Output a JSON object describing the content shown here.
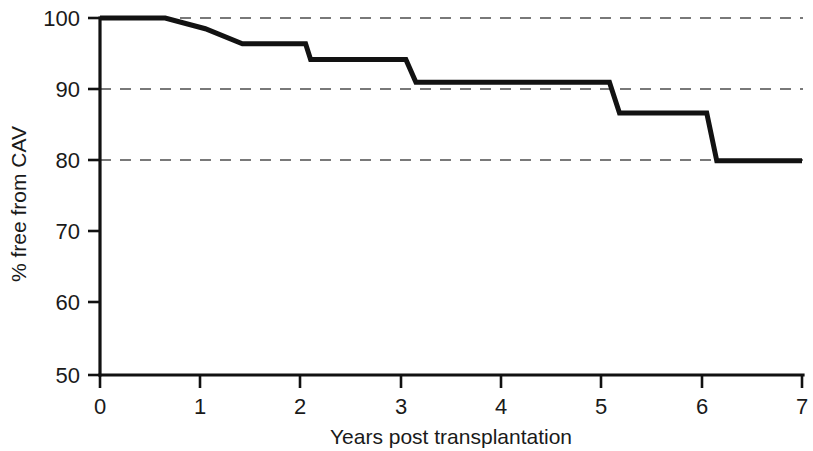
{
  "chart_data": {
    "type": "line",
    "title": "",
    "subtitle": "",
    "xlabel": "Years post transplantation",
    "ylabel": "% free from CAV",
    "xlim": [
      0,
      7
    ],
    "ylim": [
      50,
      100
    ],
    "x_ticks": [
      "0",
      "1",
      "2",
      "3",
      "4",
      "5",
      "6",
      "7"
    ],
    "x_tick_values": [
      0,
      1,
      2,
      3,
      4,
      5,
      6,
      7
    ],
    "y_ticks": [
      "50",
      "60",
      "70",
      "80",
      "90",
      "100"
    ],
    "y_tick_values": [
      50,
      60,
      70,
      80,
      90,
      100
    ],
    "grid": "horizontal dashed gridlines at y = 80, 90, 100",
    "gridline_values": [
      80,
      90,
      100
    ],
    "legend": "none",
    "annotations": [],
    "curve_style": "step",
    "line_color": "#121212",
    "series": [
      {
        "name": "Freedom from CAV",
        "x": [
          0.0,
          0.65,
          1.05,
          1.42,
          2.05,
          2.1,
          3.05,
          3.15,
          5.08,
          5.18,
          6.05,
          6.15,
          7.0
        ],
        "y": [
          100.0,
          100.0,
          98.5,
          96.4,
          96.4,
          94.2,
          94.2,
          91.0,
          91.0,
          86.7,
          86.7,
          80.0,
          80.0
        ]
      }
    ]
  },
  "axes": {
    "y_label": "% free from CAV",
    "x_label": "Years post transplantation"
  }
}
